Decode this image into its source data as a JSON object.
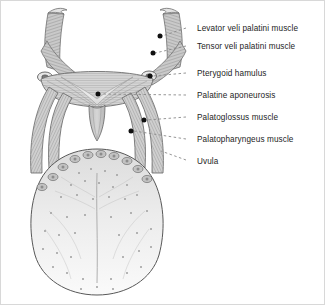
{
  "figure": {
    "background": "#ffffff",
    "border_color": "#d8d8d8",
    "ink_color": "#4a4a4a",
    "label_color": "#1d1d1d",
    "leader_color": "#8a8a8a",
    "marker_color": "#101010"
  },
  "labels": [
    {
      "id": "levator-veli-palatini",
      "text": "Levator veli palatini muscle",
      "x": 196,
      "y": 23,
      "leader": {
        "x1": 185,
        "y1": 27,
        "x2": 161,
        "y2": 35
      },
      "marker": {
        "x": 159,
        "y": 35
      }
    },
    {
      "id": "tensor-veli-palatini",
      "text": "Tensor veli palatini muscle",
      "x": 196,
      "y": 41,
      "leader": {
        "x1": 185,
        "y1": 45,
        "x2": 154,
        "y2": 52
      },
      "marker": {
        "x": 152,
        "y": 52
      }
    },
    {
      "id": "pterygoid-hamulus",
      "text": "Pterygoid hamulus",
      "x": 196,
      "y": 68,
      "leader": {
        "x1": 185,
        "y1": 72,
        "x2": 152,
        "y2": 75
      },
      "marker": {
        "x": 149,
        "y": 75
      }
    },
    {
      "id": "palatine-aponeurosis",
      "text": "Palatine aponeurosis",
      "x": 196,
      "y": 90,
      "leader": {
        "x1": 185,
        "y1": 94,
        "x2": 100,
        "y2": 93
      },
      "marker": {
        "x": 97,
        "y": 93
      }
    },
    {
      "id": "palatoglossus",
      "text": "Palatoglossus muscle",
      "x": 196,
      "y": 112,
      "leader": {
        "x1": 185,
        "y1": 116,
        "x2": 146,
        "y2": 119
      },
      "marker": {
        "x": 143,
        "y": 119
      }
    },
    {
      "id": "palatopharyngeus",
      "text": "Palatopharyngeus muscle",
      "x": 196,
      "y": 134,
      "leader": {
        "x1": 185,
        "y1": 138,
        "x2": 133,
        "y2": 130
      },
      "marker": {
        "x": 130,
        "y": 130
      }
    },
    {
      "id": "uvula",
      "text": "Uvula",
      "x": 196,
      "y": 156,
      "leader": {
        "x1": 185,
        "y1": 159,
        "x2": 160,
        "y2": 150
      },
      "marker": null
    }
  ],
  "anatomy": {
    "circumvallate_papillae_count": 10,
    "median_sulcus": true,
    "parts": [
      "levator veli palatini bundle (left)",
      "levator veli palatini bundle (right)",
      "tensor veli palatini bundle (left)",
      "tensor veli palatini bundle (right)",
      "pterygoid hamulus (left)",
      "pterygoid hamulus (right)",
      "palatine aponeurosis",
      "uvula",
      "palatoglossal arch (left)",
      "palatoglossal arch (right)",
      "palatopharyngeal arch (left)",
      "palatopharyngeal arch (right)",
      "tongue dorsum"
    ]
  }
}
